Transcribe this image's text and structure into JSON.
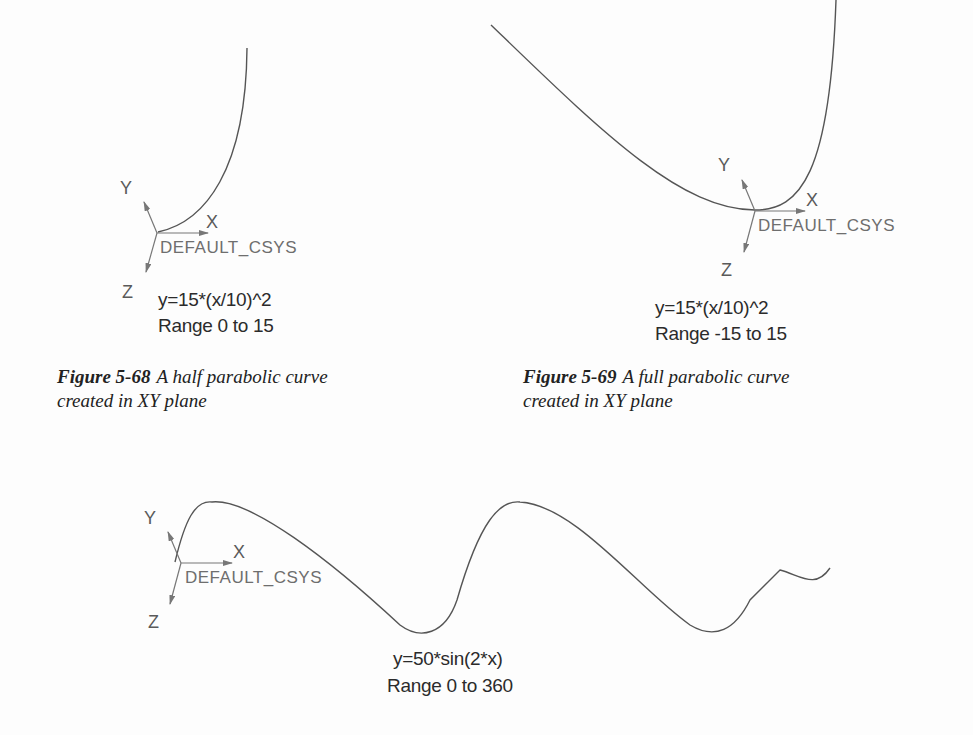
{
  "figures": [
    {
      "id": "fig-5-68",
      "csys_label": "DEFAULT_CSYS",
      "axes": {
        "x": "X",
        "y": "Y",
        "z": "Z"
      },
      "equation": "y=15*(x/10)^2",
      "range": "Range 0 to 15",
      "caption_number": "Figure 5-68",
      "caption_line1": "A half parabolic curve",
      "caption_line2": "created in XY plane"
    },
    {
      "id": "fig-5-69",
      "csys_label": "DEFAULT_CSYS",
      "axes": {
        "x": "X",
        "y": "Y",
        "z": "Z"
      },
      "equation": "y=15*(x/10)^2",
      "range": "Range -15 to 15",
      "caption_number": "Figure 5-69",
      "caption_line1": "A full parabolic curve",
      "caption_line2": "created in XY plane"
    },
    {
      "id": "fig-sine",
      "csys_label": "DEFAULT_CSYS",
      "axes": {
        "x": "X",
        "y": "Y",
        "z": "Z"
      },
      "equation": "y=50*sin(2*x)",
      "range": "Range 0 to 360"
    }
  ],
  "colors": {
    "curve": "#555555",
    "axis_arrow": "#666666",
    "text": "#222222"
  }
}
